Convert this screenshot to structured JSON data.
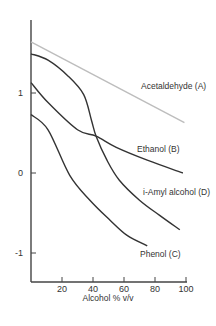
{
  "chart_data": {
    "type": "line",
    "title": "",
    "xlabel": "Alcohol % v/v",
    "ylabel": "",
    "xlim": [
      0,
      100
    ],
    "ylim": [
      -1.4,
      2.4
    ],
    "x_ticks": [
      20,
      40,
      60,
      80,
      100
    ],
    "y_ticks": [
      1,
      0,
      -1
    ],
    "grid": false,
    "legend": "inline labels at curve ends",
    "series": [
      {
        "name": "Acetaldehyde (A)",
        "color": "#bdbdbd",
        "x": [
          0,
          99
        ],
        "y": [
          1.64,
          0.63
        ],
        "label_pos": [
          141,
          89
        ]
      },
      {
        "name": "Ethanol (B)",
        "color": "#333333",
        "x": [
          0,
          11,
          30,
          42,
          55,
          75,
          98
        ],
        "y": [
          1.13,
          0.88,
          0.54,
          0.46,
          0.32,
          0.16,
          0.0
        ],
        "label_pos": [
          137,
          152
        ]
      },
      {
        "name": "i-Amyl alcohol (D)",
        "color": "#333333",
        "x": [
          0,
          11,
          24,
          34,
          39,
          42,
          49,
          57,
          70,
          83,
          96
        ],
        "y": [
          1.49,
          1.41,
          1.21,
          0.98,
          0.66,
          0.46,
          0.16,
          -0.09,
          -0.34,
          -0.53,
          -0.71
        ],
        "label_pos": [
          143,
          195
        ]
      },
      {
        "name": "Phenol (C)",
        "color": "#333333",
        "x": [
          0,
          11,
          25,
          38,
          51,
          62,
          75
        ],
        "y": [
          0.73,
          0.54,
          -0.03,
          -0.34,
          -0.59,
          -0.78,
          -0.91
        ],
        "label_pos": [
          140,
          257
        ]
      }
    ]
  }
}
